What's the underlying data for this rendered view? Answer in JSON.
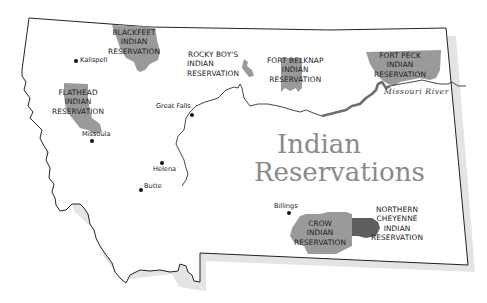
{
  "title": {
    "line1": "Indian",
    "line2": "Reservations"
  },
  "reservations": [
    {
      "id": "blackfeet",
      "lines": [
        "BLACKFEET",
        "INDIAN",
        "RESERVATION"
      ]
    },
    {
      "id": "rocky-boys",
      "lines": [
        "ROCKY BOY'S",
        "INDIAN",
        "RESERVATION"
      ]
    },
    {
      "id": "fort-belknap",
      "lines": [
        "FORT BELKNAP",
        "INDIAN",
        "RESERVATION"
      ]
    },
    {
      "id": "fort-peck",
      "lines": [
        "FORT PECK",
        "INDIAN",
        "RESERVATION"
      ]
    },
    {
      "id": "flathead",
      "lines": [
        "FLATHEAD",
        "INDIAN",
        "RESERVATION"
      ]
    },
    {
      "id": "crow",
      "lines": [
        "CROW",
        "INDIAN",
        "RESERVATION"
      ]
    },
    {
      "id": "northern-cheyenne",
      "lines": [
        "NORTHERN",
        "CHEYENNE",
        "INDIAN",
        "RESERVATION"
      ]
    }
  ],
  "cities": [
    {
      "name": "Kalispell"
    },
    {
      "name": "Great Falls"
    },
    {
      "name": "Missoula"
    },
    {
      "name": "Helena"
    },
    {
      "name": "Butte"
    },
    {
      "name": "Billings"
    }
  ],
  "river": {
    "name": "Missouri River"
  },
  "colors": {
    "reservation_fill": "#9a9a9a",
    "northern_cheyenne_fill": "#5e5e5e",
    "river": "#6e6e6e",
    "outline": "#222222",
    "title": "#8a8a8a",
    "shadow": "#d0d0d0"
  }
}
